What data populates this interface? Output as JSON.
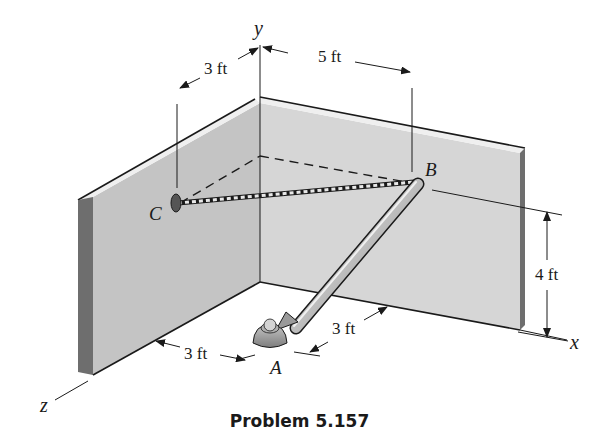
{
  "figure": {
    "caption": "Problem 5.157",
    "axes": {
      "x": "x",
      "y": "y",
      "z": "z"
    },
    "points": {
      "A": "A",
      "B": "B",
      "C": "C"
    },
    "dimensions": {
      "c_from_corner": "3 ft",
      "b_from_corner": "5 ft",
      "b_height": "4 ft",
      "a_from_left_wall": "3 ft",
      "a_from_back_wall": "3 ft"
    },
    "elements": [
      "left-wall",
      "back-wall",
      "floor",
      "rod-AB",
      "cable-BC",
      "ball-socket-A",
      "eyebolt-C"
    ],
    "colors": {
      "wall_face": "#c9c9c9",
      "wall_face_back": "#d6d6d6",
      "wall_edge": "#6e6e6e",
      "wall_top": "#ededed",
      "rod": "#b8b8b8",
      "outline": "#1a1a1a"
    }
  }
}
